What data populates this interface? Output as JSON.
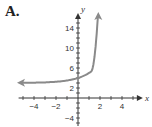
{
  "panel_label": "A.",
  "chart_data": {
    "type": "line",
    "title": "A.",
    "xlabel": "x",
    "ylabel": "y",
    "xlim": [
      -5.5,
      5.5
    ],
    "ylim": [
      -5,
      16
    ],
    "x_ticks": [
      -4,
      -2,
      2,
      4
    ],
    "y_ticks": [
      14,
      10,
      6,
      2,
      -4
    ],
    "grid": false,
    "series": [
      {
        "name": "exponential curve",
        "color": "#8a8a8a",
        "function": "y = 2^x + 3",
        "x": [
          -5.3,
          -4,
          -3,
          -2,
          -1,
          0,
          0.5,
          1,
          1.5,
          1.8
        ],
        "y": [
          3.03,
          3.06,
          3.13,
          3.25,
          3.5,
          4,
          4.41,
          5,
          5.83,
          16
        ],
        "left_arrow": true,
        "right_arrow": true,
        "y_intercept": 4,
        "horizontal_asymptote": 3
      }
    ]
  }
}
